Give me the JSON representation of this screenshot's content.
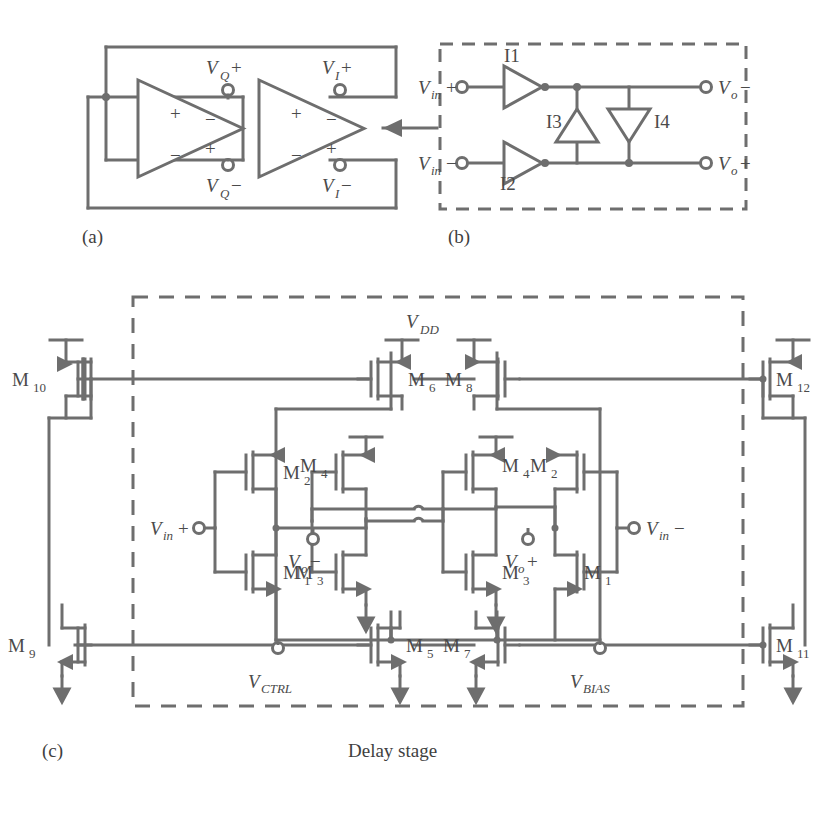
{
  "figure": {
    "stroke_color": "#6e6e6e",
    "text_color": "#4a4a4a",
    "background": "#ffffff",
    "line_width": 3
  },
  "panel_a": {
    "caption": "(a)",
    "description": "Two-stage differential ring oscillator with cross-coupled feedback",
    "stage1": {
      "name": "amplifier-stage-1",
      "in_plus": "+",
      "in_minus": "−",
      "out_plus": "+",
      "out_minus": "−"
    },
    "stage2": {
      "name": "amplifier-stage-2",
      "in_plus": "+",
      "in_minus": "−",
      "out_plus": "+",
      "out_minus": "−"
    },
    "nodes": [
      {
        "id": "vq_plus",
        "base": "V",
        "sub": "Q",
        "sign": "+",
        "text": "VQ+"
      },
      {
        "id": "vq_minus",
        "base": "V",
        "sub": "Q",
        "sign": "−",
        "text": "VQ−"
      },
      {
        "id": "vi_plus",
        "base": "V",
        "sub": "I",
        "sign": "+",
        "text": "VI+"
      },
      {
        "id": "vi_minus",
        "base": "V",
        "sub": "I",
        "sign": "−",
        "text": "VI−"
      }
    ]
  },
  "panel_b": {
    "caption": "(b)",
    "description": "Delay cell implemented with four inverters, dashed boundary",
    "inverters": [
      {
        "id": "I1",
        "label": "I1"
      },
      {
        "id": "I2",
        "label": "I2"
      },
      {
        "id": "I3",
        "label": "I3"
      },
      {
        "id": "I4",
        "label": "I4"
      }
    ],
    "ports": [
      {
        "id": "vin_plus",
        "base": "V",
        "sub": "in",
        "sign": "+",
        "text": "Vin+"
      },
      {
        "id": "vin_minus",
        "base": "V",
        "sub": "in",
        "sign": "−",
        "text": "Vin−"
      },
      {
        "id": "vo_minus",
        "base": "V",
        "sub": "o",
        "sign": "−",
        "text": "Vo−"
      },
      {
        "id": "vo_plus",
        "base": "V",
        "sub": "o",
        "sign": "+",
        "text": "Vo+"
      }
    ]
  },
  "panel_c": {
    "caption": "(c)",
    "block_label": "Delay stage",
    "supply": {
      "base": "V",
      "sub": "DD",
      "text": "VDD"
    },
    "ports": [
      {
        "id": "vin_plus",
        "base": "V",
        "sub": "in",
        "sign": "+",
        "text": "Vin+"
      },
      {
        "id": "vin_minus",
        "base": "V",
        "sub": "in",
        "sign": "−",
        "text": "Vin−"
      },
      {
        "id": "vo_minus",
        "base": "V",
        "sub": "o",
        "sign": "−",
        "text": "Vo−"
      },
      {
        "id": "vo_plus",
        "base": "V",
        "sub": "o",
        "sign": "+",
        "text": "Vo+"
      },
      {
        "id": "vctrl",
        "base": "V",
        "sub": "CTRL",
        "sign": "",
        "text": "VCTRL"
      },
      {
        "id": "vbias",
        "base": "V",
        "sub": "BIAS",
        "sign": "",
        "text": "VBIAS"
      }
    ],
    "transistors": [
      {
        "id": "M1L",
        "base": "M",
        "sub": "1",
        "text": "M1",
        "type": "nmos"
      },
      {
        "id": "M2L",
        "base": "M",
        "sub": "2",
        "text": "M2",
        "type": "pmos"
      },
      {
        "id": "M3L",
        "base": "M",
        "sub": "3",
        "text": "M3",
        "type": "nmos"
      },
      {
        "id": "M4L",
        "base": "M",
        "sub": "4",
        "text": "M4",
        "type": "pmos"
      },
      {
        "id": "M3R",
        "base": "M",
        "sub": "3",
        "text": "M3",
        "type": "nmos"
      },
      {
        "id": "M4R",
        "base": "M",
        "sub": "4",
        "text": "M4",
        "type": "pmos"
      },
      {
        "id": "M1R",
        "base": "M",
        "sub": "1",
        "text": "M1",
        "type": "nmos"
      },
      {
        "id": "M2R",
        "base": "M",
        "sub": "2",
        "text": "M2",
        "type": "pmos"
      },
      {
        "id": "M5",
        "base": "M",
        "sub": "5",
        "text": "M5",
        "type": "nmos"
      },
      {
        "id": "M6",
        "base": "M",
        "sub": "6",
        "text": "M6",
        "type": "pmos"
      },
      {
        "id": "M7",
        "base": "M",
        "sub": "7",
        "text": "M7",
        "type": "nmos"
      },
      {
        "id": "M8",
        "base": "M",
        "sub": "8",
        "text": "M8",
        "type": "pmos"
      },
      {
        "id": "M9",
        "base": "M",
        "sub": "9",
        "text": "M9",
        "type": "nmos"
      },
      {
        "id": "M10",
        "base": "M",
        "sub": "10",
        "text": "M10",
        "type": "pmos"
      },
      {
        "id": "M11",
        "base": "M",
        "sub": "11",
        "text": "M11",
        "type": "nmos"
      },
      {
        "id": "M12",
        "base": "M",
        "sub": "12",
        "text": "M12",
        "type": "pmos"
      }
    ]
  }
}
